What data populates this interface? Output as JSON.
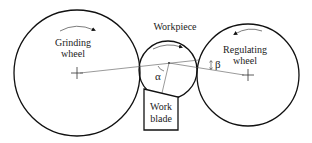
{
  "diagram": {
    "type": "centerless-grinding-schematic",
    "labels": {
      "grinding_wheel_line1": "Grinding",
      "grinding_wheel_line2": "wheel",
      "workpiece": "Workpiece",
      "regulating_wheel_line1": "Regulating",
      "regulating_wheel_line2": "wheel",
      "work_blade_line1": "Work",
      "work_blade_line2": "blade",
      "alpha": "α",
      "beta": "β"
    },
    "components": [
      {
        "name": "Grinding wheel",
        "shape": "circle",
        "rotation": "clockwise"
      },
      {
        "name": "Workpiece",
        "shape": "circle",
        "rotation": "clockwise"
      },
      {
        "name": "Regulating wheel",
        "shape": "circle",
        "rotation": "counter-clockwise"
      },
      {
        "name": "Work blade",
        "shape": "quadrilateral with sloped top"
      }
    ],
    "angles": [
      "α",
      "β"
    ],
    "colors": {
      "stroke": "#111111",
      "background": "#ffffff"
    }
  }
}
